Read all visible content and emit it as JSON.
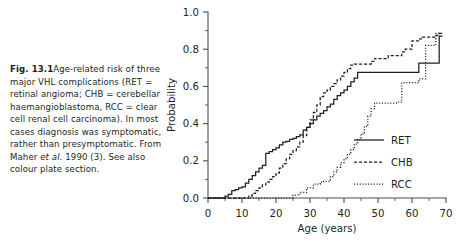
{
  "caption": {
    "figure_label": "Fig. 13.1",
    "text_part_1": "Age-related risk of three major VHL complications (RET = retinal angioma; CHB = cerebellar haemangioblastoma, RCC = clear cell renal cell carcinoma). In most cases diagnosis was symptomatic, rather than presymptomatic. From Maher ",
    "italic_part": "et al.",
    "text_part_2": " 1990 (3). See also colour plate section."
  },
  "chart_data": {
    "type": "line",
    "title": "",
    "subtitle": "",
    "xlabel": "Age  (years)",
    "ylabel": "Probability",
    "xlim": [
      0,
      70
    ],
    "ylim": [
      0.0,
      1.0
    ],
    "x_ticks": [
      0,
      10,
      20,
      30,
      40,
      50,
      60,
      70
    ],
    "x_tick_labels": [
      "0",
      "10",
      "20",
      "30",
      "40",
      "50",
      "60",
      "70"
    ],
    "x_minor_step": 5,
    "y_ticks": [
      0.0,
      0.2,
      0.4,
      0.6,
      0.8,
      1.0
    ],
    "y_tick_labels": [
      "0.0",
      "0.2",
      "0.4",
      "0.6",
      "0.8",
      "1.0"
    ],
    "y_minor_step": 0.1,
    "grid": false,
    "legend_position": "center-right",
    "series": [
      {
        "name": "RET",
        "style": "solid",
        "x": [
          0,
          5,
          5,
          6,
          6,
          7,
          7,
          8,
          8,
          9,
          9,
          10,
          10,
          11,
          11,
          12,
          12,
          13,
          13,
          14,
          14,
          15,
          15,
          16,
          16,
          17,
          17,
          18,
          18,
          19,
          19,
          20,
          20,
          21,
          21,
          22,
          22,
          23,
          23,
          24,
          24,
          25,
          25,
          26,
          26,
          27,
          27,
          28,
          28,
          29,
          29,
          30,
          30,
          31,
          31,
          32,
          32,
          33,
          33,
          34,
          34,
          35,
          35,
          36,
          36,
          37,
          37,
          38,
          38,
          39,
          39,
          40,
          40,
          41,
          41,
          42,
          42,
          43,
          43,
          44,
          44,
          62,
          62,
          68,
          68,
          69
        ],
        "y": [
          0.0,
          0.0,
          0.01,
          0.01,
          0.02,
          0.02,
          0.04,
          0.04,
          0.045,
          0.045,
          0.055,
          0.055,
          0.06,
          0.06,
          0.08,
          0.08,
          0.1,
          0.1,
          0.12,
          0.12,
          0.14,
          0.14,
          0.16,
          0.16,
          0.175,
          0.175,
          0.24,
          0.24,
          0.25,
          0.25,
          0.26,
          0.26,
          0.27,
          0.27,
          0.285,
          0.285,
          0.3,
          0.3,
          0.305,
          0.305,
          0.315,
          0.315,
          0.32,
          0.32,
          0.33,
          0.33,
          0.34,
          0.34,
          0.365,
          0.365,
          0.38,
          0.38,
          0.4,
          0.4,
          0.42,
          0.42,
          0.44,
          0.44,
          0.455,
          0.455,
          0.47,
          0.47,
          0.49,
          0.49,
          0.505,
          0.505,
          0.53,
          0.53,
          0.55,
          0.55,
          0.565,
          0.565,
          0.58,
          0.58,
          0.6,
          0.6,
          0.625,
          0.625,
          0.645,
          0.645,
          0.675,
          0.675,
          0.725,
          0.725,
          0.87,
          0.87
        ]
      },
      {
        "name": "CHB",
        "style": "dashed",
        "x": [
          0,
          12,
          12,
          13,
          13,
          14,
          14,
          15,
          15,
          16,
          16,
          17,
          17,
          18,
          18,
          19,
          19,
          20,
          20,
          21,
          21,
          22,
          22,
          23,
          23,
          24,
          24,
          25,
          25,
          26,
          26,
          27,
          27,
          28,
          28,
          29,
          29,
          30,
          30,
          31,
          31,
          32,
          32,
          33,
          33,
          34,
          34,
          35,
          35,
          36,
          36,
          37,
          37,
          38,
          38,
          39,
          39,
          40,
          40,
          41,
          41,
          42,
          42,
          43,
          43,
          48,
          48,
          49,
          49,
          53,
          53,
          57,
          57,
          58,
          58,
          60,
          60,
          62,
          62,
          63,
          63,
          67,
          67,
          68,
          68,
          69
        ],
        "y": [
          0.0,
          0.0,
          0.01,
          0.01,
          0.025,
          0.025,
          0.04,
          0.04,
          0.055,
          0.055,
          0.07,
          0.07,
          0.085,
          0.085,
          0.1,
          0.1,
          0.115,
          0.115,
          0.135,
          0.135,
          0.16,
          0.16,
          0.185,
          0.185,
          0.21,
          0.21,
          0.235,
          0.235,
          0.255,
          0.255,
          0.275,
          0.275,
          0.3,
          0.3,
          0.335,
          0.335,
          0.38,
          0.38,
          0.42,
          0.42,
          0.46,
          0.46,
          0.5,
          0.5,
          0.545,
          0.545,
          0.565,
          0.565,
          0.58,
          0.58,
          0.6,
          0.6,
          0.615,
          0.615,
          0.635,
          0.635,
          0.655,
          0.655,
          0.675,
          0.675,
          0.695,
          0.695,
          0.715,
          0.715,
          0.72,
          0.72,
          0.735,
          0.735,
          0.75,
          0.75,
          0.765,
          0.765,
          0.785,
          0.785,
          0.8,
          0.8,
          0.845,
          0.845,
          0.855,
          0.855,
          0.865,
          0.865,
          0.875,
          0.875,
          0.885,
          0.885
        ]
      },
      {
        "name": "RCC",
        "style": "dotted",
        "x": [
          0,
          25,
          25,
          27,
          27,
          29,
          29,
          31,
          31,
          33,
          33,
          34,
          34,
          36,
          36,
          37,
          37,
          38,
          38,
          39,
          39,
          40,
          40,
          41,
          41,
          42,
          42,
          43,
          43,
          44,
          44,
          45,
          45,
          46,
          46,
          47,
          47,
          48,
          48,
          49,
          49,
          56,
          56,
          57,
          57,
          62,
          62,
          64,
          64,
          67,
          67,
          69
        ],
        "y": [
          0.0,
          0.0,
          0.015,
          0.015,
          0.03,
          0.03,
          0.055,
          0.055,
          0.075,
          0.075,
          0.085,
          0.085,
          0.09,
          0.09,
          0.115,
          0.115,
          0.14,
          0.14,
          0.165,
          0.165,
          0.19,
          0.19,
          0.21,
          0.21,
          0.235,
          0.235,
          0.26,
          0.26,
          0.29,
          0.29,
          0.315,
          0.315,
          0.345,
          0.345,
          0.385,
          0.385,
          0.44,
          0.44,
          0.48,
          0.48,
          0.51,
          0.51,
          0.515,
          0.515,
          0.62,
          0.62,
          0.64,
          0.64,
          0.82,
          0.82,
          0.885,
          0.885
        ]
      }
    ]
  },
  "legend": {
    "entries": [
      {
        "label": "RET",
        "style": "solid"
      },
      {
        "label": "CHB",
        "style": "dashed"
      },
      {
        "label": "RCC",
        "style": "dotted"
      }
    ]
  },
  "colors": {
    "ink": "#231f20",
    "axis": "#4d4d4f",
    "background": "#ffffff"
  }
}
